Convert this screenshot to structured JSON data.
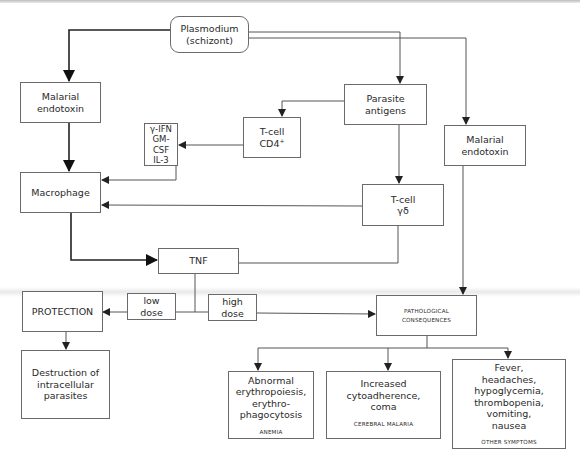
{
  "diagram": {
    "colors": {
      "line": "#555555",
      "box_border": "#6a6a6a",
      "text": "#2a2a2a",
      "background": "#ffffff"
    },
    "nodes": {
      "plasmodium": {
        "line1": "Plasmodium",
        "line2": "(schizont)"
      },
      "endotoxin_left": {
        "line1": "Malarial",
        "line2": "endotoxin"
      },
      "parasite_antigens": {
        "line1": "Parasite",
        "line2": "antigens"
      },
      "endotoxin_right": {
        "line1": "Malarial",
        "line2": "endotoxin"
      },
      "cytokines": {
        "line1": "γ-IFN",
        "line2": "GM-CSF",
        "line3": "IL-3"
      },
      "tcell_cd4": {
        "line1": "T-cell",
        "line2": "CD4",
        "sup": "+"
      },
      "macrophage": {
        "label": "Macrophage"
      },
      "tcell_gd": {
        "line1": "T-cell",
        "line2": "γδ"
      },
      "tnf": {
        "label": "TNF"
      },
      "low_dose": {
        "line1": "low",
        "line2": "dose"
      },
      "high_dose": {
        "line1": "high",
        "line2": "dose"
      },
      "protection": {
        "label": "PROTECTION"
      },
      "pathological": {
        "line1": "PATHOLOGICAL",
        "line2": "CONSEQUENCES"
      },
      "destruction": {
        "line1": "Destruction of",
        "line2": "intracellular",
        "line3": "parasites"
      },
      "anemia": {
        "lines": [
          "Abnormal",
          "erythropoiesis,",
          "erythro-",
          "phagocytosis"
        ],
        "category": "ANEMIA"
      },
      "cerebral": {
        "lines": [
          "Increased",
          "cytoadherence,",
          "coma"
        ],
        "category": "CEREBRAL MALARIA"
      },
      "other": {
        "lines": [
          "Fever,",
          "headaches,",
          "hypoglycemia,",
          "thrombopenia,",
          "vomiting,",
          "nausea"
        ],
        "category": "OTHER SYMPTOMS"
      }
    },
    "edges": [
      {
        "from": "plasmodium",
        "to": "endotoxin_left",
        "weight": "bold"
      },
      {
        "from": "plasmodium",
        "to": "parasite_antigens",
        "weight": "thin"
      },
      {
        "from": "plasmodium",
        "to": "endotoxin_right",
        "weight": "thin"
      },
      {
        "from": "parasite_antigens",
        "to": "tcell_cd4",
        "weight": "thin"
      },
      {
        "from": "parasite_antigens",
        "to": "tcell_gd",
        "weight": "thin"
      },
      {
        "from": "tcell_cd4",
        "to": "cytokines",
        "weight": "thin"
      },
      {
        "from": "cytokines",
        "to": "macrophage",
        "weight": "thin"
      },
      {
        "from": "endotoxin_left",
        "to": "macrophage",
        "weight": "bold"
      },
      {
        "from": "tcell_gd",
        "to": "macrophage",
        "weight": "thin"
      },
      {
        "from": "macrophage",
        "to": "tnf",
        "weight": "bold"
      },
      {
        "from": "tcell_gd",
        "to": "tnf",
        "weight": "thin"
      },
      {
        "from": "tnf",
        "to": "protection",
        "via": "low_dose",
        "weight": "thin"
      },
      {
        "from": "tnf",
        "to": "pathological",
        "via": "high_dose",
        "weight": "thin"
      },
      {
        "from": "endotoxin_right",
        "to": "pathological",
        "weight": "thin"
      },
      {
        "from": "protection",
        "to": "destruction",
        "weight": "thin"
      },
      {
        "from": "pathological",
        "to": "anemia",
        "weight": "thin"
      },
      {
        "from": "pathological",
        "to": "cerebral",
        "weight": "thin"
      },
      {
        "from": "pathological",
        "to": "other",
        "weight": "thin"
      }
    ]
  }
}
